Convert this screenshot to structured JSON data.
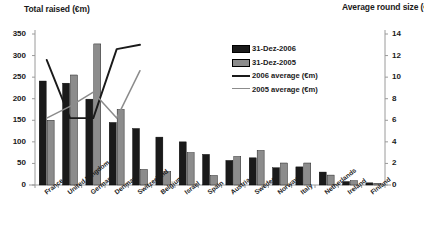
{
  "chart_data": {
    "type": "bar",
    "title": "Total raised (€m)",
    "right_title": "Average round size (€m)",
    "xlabel": "",
    "ylabel": "Total raised (€m)",
    "ylabel_right": "Average round size (€m)",
    "ylim": [
      0,
      350
    ],
    "ylim_right": [
      0,
      14
    ],
    "yticks": [
      0,
      50,
      100,
      150,
      200,
      250,
      300,
      350
    ],
    "yticks_right": [
      0,
      2,
      4,
      6,
      8,
      10,
      12,
      14
    ],
    "grid": false,
    "legend_position": "upper-center",
    "categories": [
      "France",
      "United Kingdom",
      "Germany",
      "Denmark",
      "Switzerland",
      "Belgium",
      "Israel",
      "Spain",
      "Austria",
      "Sweden",
      "Norway",
      "Italy",
      "Netherlands",
      "Ireland",
      "Finland"
    ],
    "series": [
      {
        "name": "31-Dez-2006",
        "type": "bar",
        "axis": "left",
        "color": "#1a1a1a",
        "values": [
          241,
          236,
          199,
          145,
          131,
          111,
          100,
          71,
          57,
          63,
          40,
          42,
          30,
          8,
          5
        ]
      },
      {
        "name": "31-Dez-2005",
        "type": "bar",
        "axis": "left",
        "color": "#8c8c8c",
        "values": [
          150,
          255,
          327,
          175,
          36,
          31,
          75,
          22,
          66,
          80,
          51,
          51,
          23,
          10,
          4
        ]
      },
      {
        "name": "2006 average (€m)",
        "type": "line",
        "axis": "right",
        "color": "#1a1a1a",
        "values": [
          11.6,
          6.2,
          6.2,
          12.6,
          13.0,
          null,
          null,
          null,
          null,
          null,
          null,
          null,
          null,
          null,
          null
        ]
      },
      {
        "name": "2005 average (€m)",
        "type": "line",
        "axis": "right",
        "color": "#8c8c8c",
        "values": [
          6.2,
          7.3,
          8.6,
          6.2,
          10.6,
          null,
          null,
          null,
          null,
          null,
          null,
          null,
          null,
          null,
          null
        ]
      }
    ],
    "legend": [
      {
        "label": "31-Dez-2006",
        "marker": "bar-black"
      },
      {
        "label": "31-Dez-2005",
        "marker": "bar-grey"
      },
      {
        "label": "2006 average (€m)",
        "marker": "line-black"
      },
      {
        "label": "2005 average (€m)",
        "marker": "line-grey"
      }
    ]
  },
  "colors": {
    "bar_2006": "#1a1a1a",
    "bar_2005": "#8c8c8c",
    "line_2006": "#1a1a1a",
    "line_2005": "#8c8c8c",
    "axis": "#9a9a9a",
    "text": "#1a1a1a",
    "background": "#ffffff"
  }
}
